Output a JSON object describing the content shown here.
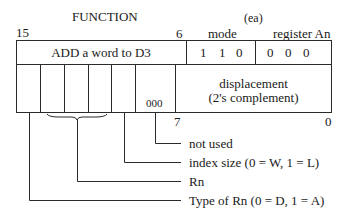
{
  "header": {
    "function_label": "FUNCTION",
    "ea_label": "(ea)",
    "mode_label": "mode",
    "register_label": "register An",
    "bit_15": "15",
    "bit_6": "6"
  },
  "top_row": {
    "function_text": "ADD a word to D3",
    "mode_bits": [
      "1",
      "1",
      "0"
    ],
    "register_bits": [
      "0",
      "0",
      "0"
    ]
  },
  "bottom_row": {
    "unused_bits": "000",
    "displacement_line1": "displacement",
    "displacement_line2": "(2's complement)",
    "bit_7": "7",
    "bit_0": "0"
  },
  "annotations": [
    {
      "label": "not used"
    },
    {
      "label": "index size (0 = W, 1 = L)"
    },
    {
      "label": "Rn"
    },
    {
      "label": "Type of Rn (0 = D, 1 = A)"
    }
  ],
  "colors": {
    "line": "#2a2a2a",
    "text": "#1a1a1a",
    "background": "#ffffff"
  }
}
